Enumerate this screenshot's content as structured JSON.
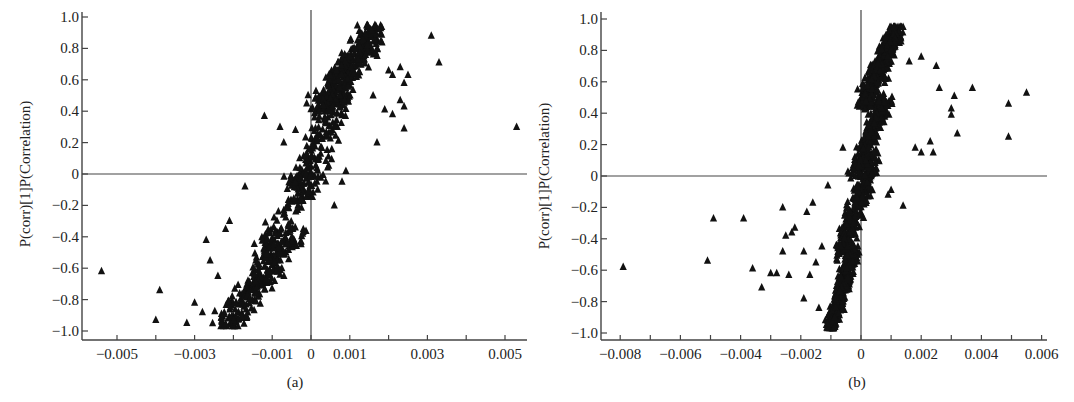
{
  "colors": {
    "axis": "#444444",
    "marker": "#111111",
    "background": "#ffffff"
  },
  "chart_data": [
    {
      "id": "a",
      "type": "scatter",
      "panel_label": "(a)",
      "title": "",
      "xlabel": "",
      "ylabel": "P(corr)[1]P(Correlation)",
      "marker": "triangle",
      "xlim": [
        -0.0056,
        0.0057
      ],
      "ylim": [
        -1.05,
        1.05
      ],
      "xticks": [
        -0.005,
        -0.004,
        -0.003,
        -0.002,
        -0.001,
        0,
        0.001,
        0.002,
        0.003,
        0.004,
        0.005
      ],
      "xtick_labels": [
        "-0.005",
        "",
        "-0.003",
        "",
        "-0.001",
        "0",
        "0.001",
        "",
        "0.003",
        "",
        "0.005"
      ],
      "yticks": [
        -1.0,
        -0.8,
        -0.6,
        -0.4,
        -0.2,
        0,
        0.2,
        0.4,
        0.6,
        0.8,
        1.0
      ],
      "ytick_labels": [
        "-1.0",
        "-0.8",
        "-0.6",
        "-0.4",
        "-0.2",
        "0",
        "0.2",
        "0.4",
        "0.6",
        "0.8",
        "1.0"
      ],
      "reference_lines": {
        "x": 0,
        "y": 0
      },
      "layout": {
        "plot_left": 82,
        "plot_right": 527,
        "plot_top": 12,
        "plot_bottom": 340,
        "y_top_px": 17,
        "y_bottom_px": 331,
        "x_at_zero_px": 311,
        "px_per_unit_x": 38800
      },
      "cloud": {
        "description": "dense S-shaped cluster rising from lower-left to upper-right through origin",
        "count": 900,
        "segments": [
          {
            "x": [
              -0.0022,
              -0.0005
            ],
            "y": [
              -0.98,
              -0.4
            ],
            "weight": 0.3
          },
          {
            "x": [
              -0.0012,
              0.0003
            ],
            "y": [
              -0.5,
              0.1
            ],
            "weight": 0.15
          },
          {
            "x": [
              -0.0005,
              0.0009
            ],
            "y": [
              -0.1,
              0.5
            ],
            "weight": 0.15
          },
          {
            "x": [
              0.0002,
              0.0017
            ],
            "y": [
              0.4,
              0.93
            ],
            "weight": 0.4
          }
        ]
      },
      "outliers": [
        [
          -0.0054,
          -0.62
        ],
        [
          -0.004,
          -0.93
        ],
        [
          -0.0039,
          -0.74
        ],
        [
          -0.0032,
          -0.95
        ],
        [
          -0.003,
          -0.82
        ],
        [
          -0.0028,
          -0.88
        ],
        [
          -0.0027,
          -0.42
        ],
        [
          -0.0026,
          -0.55
        ],
        [
          -0.0024,
          -0.65
        ],
        [
          -0.0022,
          -0.35
        ],
        [
          -0.0021,
          -0.3
        ],
        [
          -0.002,
          -0.93
        ],
        [
          -0.0017,
          -0.08
        ],
        [
          -0.0012,
          0.37
        ],
        [
          -0.0008,
          0.3
        ],
        [
          -0.0007,
          0.2
        ],
        [
          -0.0004,
          0.28
        ],
        [
          0.0031,
          0.88
        ],
        [
          0.0033,
          0.71
        ],
        [
          0.0053,
          0.3
        ],
        [
          0.002,
          0.66
        ],
        [
          0.0021,
          0.63
        ],
        [
          0.0023,
          0.68
        ],
        [
          0.0025,
          0.63
        ],
        [
          0.0024,
          0.58
        ],
        [
          0.0023,
          0.47
        ],
        [
          0.0024,
          0.43
        ],
        [
          0.0024,
          0.29
        ],
        [
          0.0017,
          0.2
        ],
        [
          0.0021,
          0.38
        ],
        [
          0.0019,
          0.41
        ],
        [
          0.0009,
          0.02
        ],
        [
          0.0006,
          -0.2
        ],
        [
          0.0008,
          -0.05
        ],
        [
          0.0016,
          0.5
        ]
      ]
    },
    {
      "id": "b",
      "type": "scatter",
      "panel_label": "(b)",
      "title": "",
      "xlabel": "",
      "ylabel": "P(corr)[1]P(Correlation)",
      "marker": "triangle",
      "xlim": [
        -0.0087,
        0.0062
      ],
      "ylim": [
        -1.05,
        1.05
      ],
      "xticks": [
        -0.008,
        -0.007,
        -0.006,
        -0.005,
        -0.004,
        -0.003,
        -0.002,
        -0.001,
        0,
        0.001,
        0.002,
        0.003,
        0.004,
        0.005,
        0.006
      ],
      "xtick_labels": [
        "-0.008",
        "",
        "-0.006",
        "",
        "-0.004",
        "",
        "-0.002",
        "",
        "0",
        "",
        "0.002",
        "",
        "0.004",
        "",
        "0.006"
      ],
      "yticks": [
        -1.0,
        -0.8,
        -0.6,
        -0.4,
        -0.2,
        0,
        0.2,
        0.4,
        0.6,
        0.8,
        1.0
      ],
      "ytick_labels": [
        "-1.0",
        "-0.8",
        "-0.6",
        "-0.4",
        "-0.2",
        "0",
        "0.2",
        "0.4",
        "0.6",
        "0.8",
        "1.0"
      ],
      "reference_lines": {
        "x": 0,
        "y": 0
      },
      "layout": {
        "plot_left": 601,
        "plot_right": 1047,
        "plot_top": 12,
        "plot_bottom": 340,
        "y_top_px": 19,
        "y_bottom_px": 333,
        "x_at_zero_px": 861,
        "px_per_unit_x": 30100
      },
      "cloud": {
        "description": "very dense narrow diagonal cluster through origin, steep slope",
        "count": 1400,
        "segments": [
          {
            "x": [
              -0.001,
              -0.0002
            ],
            "y": [
              -0.95,
              -0.45
            ],
            "weight": 0.3
          },
          {
            "x": [
              -0.0007,
              0.0004
            ],
            "y": [
              -0.5,
              0.1
            ],
            "weight": 0.2
          },
          {
            "x": [
              -0.0002,
              0.0008
            ],
            "y": [
              0.0,
              0.5
            ],
            "weight": 0.2
          },
          {
            "x": [
              0.0001,
              0.0012
            ],
            "y": [
              0.45,
              0.95
            ],
            "weight": 0.3
          }
        ]
      },
      "outliers": [
        [
          -0.0079,
          -0.58
        ],
        [
          -0.0051,
          -0.54
        ],
        [
          -0.0049,
          -0.27
        ],
        [
          -0.0039,
          -0.27
        ],
        [
          -0.0036,
          -0.59
        ],
        [
          -0.0033,
          -0.71
        ],
        [
          -0.003,
          -0.62
        ],
        [
          -0.0028,
          -0.62
        ],
        [
          -0.0026,
          -0.48
        ],
        [
          -0.0026,
          -0.2
        ],
        [
          -0.0025,
          -0.38
        ],
        [
          -0.0024,
          -0.63
        ],
        [
          -0.0023,
          -0.36
        ],
        [
          -0.0022,
          -0.33
        ],
        [
          -0.0019,
          -0.48
        ],
        [
          -0.0019,
          -0.78
        ],
        [
          -0.0018,
          -0.23
        ],
        [
          -0.0017,
          -0.63
        ],
        [
          -0.0016,
          -0.17
        ],
        [
          -0.0015,
          -0.55
        ],
        [
          -0.0014,
          -0.84
        ],
        [
          -0.0013,
          -0.45
        ],
        [
          -0.0011,
          -0.06
        ],
        [
          -0.0006,
          0.18
        ],
        [
          0.0014,
          0.95
        ],
        [
          0.002,
          0.76
        ],
        [
          0.0025,
          0.7
        ],
        [
          0.0026,
          0.56
        ],
        [
          0.0031,
          0.51
        ],
        [
          0.003,
          0.43
        ],
        [
          0.003,
          0.39
        ],
        [
          0.0032,
          0.27
        ],
        [
          0.0037,
          0.56
        ],
        [
          0.0049,
          0.46
        ],
        [
          0.0049,
          0.25
        ],
        [
          0.0055,
          0.53
        ],
        [
          0.0023,
          0.22
        ],
        [
          0.0024,
          0.15
        ],
        [
          0.002,
          0.15
        ],
        [
          0.0018,
          0.18
        ],
        [
          0.0014,
          -0.19
        ],
        [
          0.001,
          -0.09
        ],
        [
          0.0009,
          -0.12
        ],
        [
          0.0016,
          0.73
        ]
      ]
    }
  ]
}
